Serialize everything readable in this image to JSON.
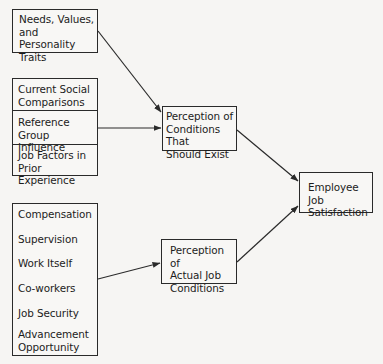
{
  "diagram": {
    "nodes": {
      "needs": {
        "label": "Needs, Values,\nand Personality\nTraits"
      },
      "social_group": {
        "items": [
          {
            "label": "Current Social\nComparisons"
          },
          {
            "label": "Reference\nGroup Influence"
          },
          {
            "label": "Job Factors in\nPrior Experience"
          }
        ]
      },
      "job_facets": {
        "items": [
          {
            "label": "Compensation"
          },
          {
            "label": "Supervision"
          },
          {
            "label": "Work Itself"
          },
          {
            "label": "Co-workers"
          },
          {
            "label": "Job Security"
          },
          {
            "label": "Advancement\nOpportunity"
          }
        ]
      },
      "should_exist": {
        "label": "Perception of\nConditions That\nShould Exist"
      },
      "actual": {
        "label": "Perception of\nActual Job\nConditions"
      },
      "satisfaction": {
        "label": "Employee Job\nSatisfaction"
      }
    },
    "edges": [
      {
        "from": "needs",
        "to": "should_exist"
      },
      {
        "from": "social_group",
        "to": "should_exist"
      },
      {
        "from": "job_facets",
        "to": "actual"
      },
      {
        "from": "should_exist",
        "to": "satisfaction"
      },
      {
        "from": "actual",
        "to": "satisfaction"
      }
    ],
    "colors": {
      "line": "#2a2a2a",
      "background": "#f6f5f3"
    }
  }
}
